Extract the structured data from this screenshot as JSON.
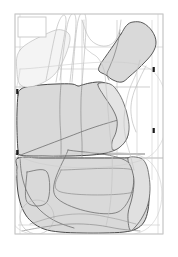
{
  "document": {
    "type": "cad-pattern-marker-layout",
    "title": "Pattern Nesting Marker",
    "page_background": "#ffffff",
    "canvas_width": 178,
    "canvas_height": 257
  },
  "colors": {
    "page_bg": "#ffffff",
    "sheet_border": "#c8c8c8",
    "title_block_border": "#c0c0c0",
    "piece_fill_shaded": "#d9d9d9",
    "piece_fill_light": "#f2f2f2",
    "piece_outline_dark": "#4a4a4a",
    "piece_outline_mid": "#8c8c8c",
    "piece_outline_light": "#bdbdbd",
    "grid_line": "#c4c4c4",
    "notch_marker": "#1a1a1a"
  },
  "sheet": {
    "name": "marker-sheet",
    "x": 15,
    "y": 14,
    "width": 148,
    "height": 220,
    "stroke": "#c8c8c8",
    "stroke_width": 0.8
  },
  "title_block": {
    "name": "title-block",
    "x": 18,
    "y": 17,
    "width": 28,
    "height": 20,
    "label": "",
    "stroke": "#c0c0c0"
  },
  "grid_lines": {
    "name": "construction-grid",
    "horizontal": [
      {
        "y": 47,
        "x1": 15,
        "x2": 163,
        "stroke": "#c8c8c8",
        "width": 0.6
      },
      {
        "y": 69,
        "x1": 18,
        "x2": 155,
        "stroke": "#c8c8c8",
        "width": 0.6
      },
      {
        "y": 87,
        "x1": 15,
        "x2": 150,
        "stroke": "#b9b9b9",
        "width": 0.7
      },
      {
        "y": 154,
        "x1": 15,
        "x2": 145,
        "stroke": "#6e6e6e",
        "width": 0.9
      },
      {
        "y": 158,
        "x1": 15,
        "x2": 163,
        "stroke": "#9a9a9a",
        "width": 0.7
      },
      {
        "y": 225,
        "x1": 18,
        "x2": 160,
        "stroke": "#c8c8c8",
        "width": 0.6
      }
    ],
    "vertical": [
      {
        "x": 20,
        "y1": 14,
        "y2": 234,
        "stroke": "#cdcdcd",
        "width": 0.6
      },
      {
        "x": 61,
        "y1": 40,
        "y2": 230,
        "stroke": "#c4c4c4",
        "width": 0.6
      },
      {
        "x": 82,
        "y1": 20,
        "y2": 212,
        "stroke": "#c4c4c4",
        "width": 0.6
      },
      {
        "x": 117,
        "y1": 20,
        "y2": 205,
        "stroke": "#bdbdbd",
        "width": 0.6
      },
      {
        "x": 137,
        "y1": 52,
        "y2": 200,
        "stroke": "#c8c8c8",
        "width": 0.6
      },
      {
        "x": 152,
        "y1": 20,
        "y2": 180,
        "stroke": "#cdcdcd",
        "width": 0.6
      },
      {
        "x": 158,
        "y1": 14,
        "y2": 234,
        "stroke": "#cdcdcd",
        "width": 0.6
      }
    ]
  },
  "notch_markers": [
    {
      "name": "notch-left-upper",
      "x": 16.2,
      "y": 89,
      "w": 2.2,
      "h": 5.0
    },
    {
      "name": "notch-left-lower",
      "x": 16.2,
      "y": 150,
      "w": 2.2,
      "h": 5.0
    },
    {
      "name": "notch-right-upper",
      "x": 152.6,
      "y": 67,
      "w": 2.2,
      "h": 5.0
    },
    {
      "name": "notch-right-lower",
      "x": 152.6,
      "y": 128,
      "w": 2.2,
      "h": 5.0
    }
  ],
  "pattern_pieces": [
    {
      "name": "sleeve-panel-right",
      "description": "angled shaded sleeve piece upper right",
      "fill": "#d9d9d9",
      "stroke": "#4a4a4a",
      "stroke_width": 0.9,
      "points": "121,34 126.5,25.5 133,22 143,23 152,31 156,42 152.5,53 142,65 130,76 122,82 113,80 106,75 99,71 100,65 106,56 113,46"
    },
    {
      "name": "sleeve-panel-right-inner-seam",
      "description": "inner seam curve of sleeve panel",
      "fill": "none",
      "stroke": "#7a7a7a",
      "stroke_width": 0.7,
      "points": "120,30 118,42 114,56 110,66 107,74 109,80"
    },
    {
      "name": "bodice-front-main",
      "description": "large central shaded bodice panel",
      "fill": "#d9d9d9",
      "stroke": "#4a4a4a",
      "stroke_width": 1.0,
      "points": "18,95 20,90 26,87 40,85 56,84 72,84 78,86 82,85 90,83 100,82 108,84 114,88 119,96 123,108 126,120 128,130 127,138 122,145 115,150 106,153 92,155 70,156 48,156 30,156 20,155 18,150 17,130 17,112"
    },
    {
      "name": "bodice-front-seam-a",
      "description": "vertical style seam line in bodice",
      "fill": "none",
      "stroke": "#8c8c8c",
      "stroke_width": 0.7,
      "points": "61,84 60,100 60,120 61,140 61,156"
    },
    {
      "name": "bodice-front-seam-b",
      "description": "second vertical style seam line in bodice",
      "fill": "none",
      "stroke": "#8c8c8c",
      "stroke_width": 0.7,
      "points": "82,84 81,100 81,122 82,142 82,156"
    },
    {
      "name": "bodice-dart-diagonal",
      "description": "diagonal dart / hem line crossing bodice",
      "fill": "none",
      "stroke": "#6e6e6e",
      "stroke_width": 0.8,
      "points": "18,156 60,140 92,128 118,120"
    },
    {
      "name": "side-panel-right-upper",
      "description": "curved right side panel with armhole scoop",
      "fill": "#e4e4e4",
      "stroke": "#5a5a5a",
      "stroke_width": 0.8,
      "points": "98,84 110,84 118,92 124,104 128,118 129,130 126,140 120,147 113,150 112,142 116,132 117,120 112,108 104,96"
    },
    {
      "name": "skirt-panel-main",
      "description": "large lower shaded skirt panel",
      "fill": "#d9d9d9",
      "stroke": "#4a4a4a",
      "stroke_width": 1.0,
      "points": "18,158 42,158 70,158 98,158 120,158 134,158 140,160 145,168 148,180 149,196 148,210 144,222 136,229 124,232 104,233 82,233 60,232 44,229 32,222 24,212 19,198 17,182 17,168"
    },
    {
      "name": "skirt-pocket-rect",
      "description": "rectangular pocket outline on skirt",
      "fill": "none",
      "stroke": "#6e6e6e",
      "stroke_width": 0.8,
      "points": "27,172 47,172 47,202 27,202 27,172"
    },
    {
      "name": "skirt-diagonal-panel",
      "description": "rotated diagonal panel over skirt",
      "fill": "none",
      "stroke": "#6e6e6e",
      "stroke_width": 0.8,
      "points": "68,150 130,164 118,212 56,197 68,150"
    },
    {
      "name": "skirt-inner-rect",
      "description": "inner rectangular piece on skirt",
      "fill": "none",
      "stroke": "#8c8c8c",
      "stroke_width": 0.7,
      "points": "61,170 134,170 134,192 61,192 61,170"
    },
    {
      "name": "skirt-curve-left",
      "description": "large curved hem arc on left of skirt",
      "fill": "none",
      "stroke": "#6e6e6e",
      "stroke_width": 0.8,
      "points": "20,158 22,176 28,194 38,208 50,218 62,224 74,228"
    },
    {
      "name": "skirt-circle-left",
      "description": "small circular piece lower left",
      "fill": "none",
      "stroke": "#bdbdbd",
      "stroke_width": 0.7,
      "cx": 37,
      "cy": 217,
      "r": 17
    },
    {
      "name": "skirt-waist-right",
      "description": "right skirt waist notch shape",
      "fill": "#e0e0e0",
      "stroke": "#5a5a5a",
      "stroke_width": 0.8,
      "points": "128,158 140,158 146,164 149,176 150,190 148,204 143,216 136,226 130,230 128,214 132,198 134,182 132,170"
    },
    {
      "name": "collar-piece-upper-left",
      "description": "light rotated collar/facing piece upper left",
      "fill": "#f4f4f4",
      "stroke": "#bdbdbd",
      "stroke_width": 0.7,
      "points": "20,50 46,34 62,30 70,40 58,70 40,84 22,86 17,72"
    },
    {
      "name": "facing-strip-1",
      "description": "narrow rotated facing strip",
      "fill": "none",
      "stroke": "#bdbdbd",
      "stroke_width": 0.7,
      "points": "46,80 58,24 66,22 56,82"
    },
    {
      "name": "facing-strip-2",
      "description": "second narrow rotated facing strip",
      "fill": "none",
      "stroke": "#bdbdbd",
      "stroke_width": 0.7,
      "points": "60,80 68,22 76,21 70,82"
    },
    {
      "name": "facing-strip-3",
      "description": "third narrow rotated facing strip",
      "fill": "none",
      "stroke": "#bdbdbd",
      "stroke_width": 0.7,
      "points": "72,82 78,21 86,20 82,84"
    },
    {
      "name": "neckline-curve",
      "description": "neckline scoop curve top centre",
      "fill": "none",
      "stroke": "#bdbdbd",
      "stroke_width": 0.7,
      "points": "82,20 88,36 96,44 106,46 114,42 119,32 121,20"
    },
    {
      "name": "back-bodice-outline",
      "description": "light back bodice outline behind main piece",
      "fill": "none",
      "stroke": "#c4c4c4",
      "stroke_width": 0.7,
      "points": "84,20 84,44 90,52 98,58 104,70 106,86 108,110 110,134 112,152 112,180 110,206 106,226"
    },
    {
      "name": "back-side-outline",
      "description": "light outline on right of back bodice",
      "fill": "none",
      "stroke": "#c4c4c4",
      "stroke_width": 0.7,
      "points": "140,60 136,74 130,88 126,104 124,122 126,140 130,154 134,170"
    },
    {
      "name": "armhole-curve-right",
      "description": "armhole curve right side",
      "fill": "none",
      "stroke": "#bdbdbd",
      "stroke_width": 0.7,
      "points": "146,66 140,78 134,92 131,106 132,120 136,132"
    },
    {
      "name": "hem-curve-bottom",
      "description": "sweeping hem curve at bottom of marker",
      "fill": "none",
      "stroke": "#8c8c8c",
      "stroke_width": 0.7,
      "points": "22,231 44,227 70,224 96,225 120,229 140,231"
    },
    {
      "name": "hem-curve-bottom-2",
      "description": "second sweeping hem curve at bottom",
      "fill": "none",
      "stroke": "#9a9a9a",
      "stroke_width": 0.6,
      "points": "30,224 58,216 86,214 112,218 136,224"
    },
    {
      "name": "outer-light-frame-left",
      "description": "light construction rectangle left",
      "fill": "none",
      "stroke": "#cdcdcd",
      "stroke_width": 0.6,
      "points": "20,69 150,69 150,156 20,156 20,69"
    },
    {
      "name": "outer-light-frame-lower",
      "description": "light construction rectangle lower",
      "fill": "none",
      "stroke": "#cdcdcd",
      "stroke_width": 0.6,
      "points": "20,158 145,158 145,230 20,230 20,158"
    }
  ],
  "legend": {
    "visible": false,
    "entries": []
  }
}
